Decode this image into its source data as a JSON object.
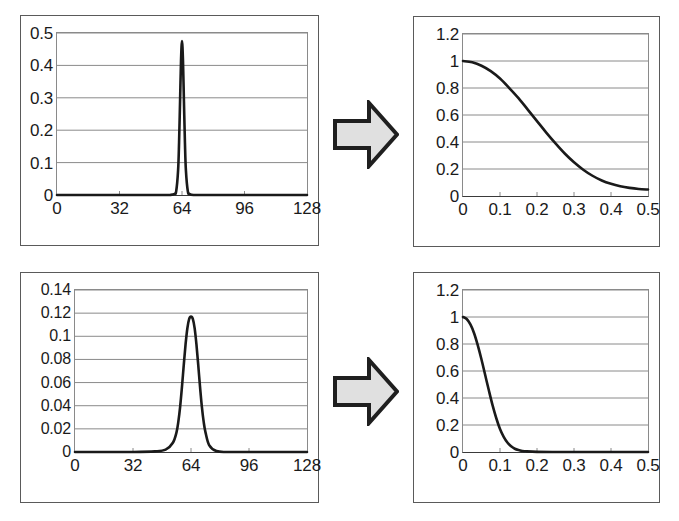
{
  "figure": {
    "title": "",
    "layout": "2x2 grid of plots with block arrows between left and right columns",
    "arrow_fill": "#e0e0e0",
    "arrow_stroke": "#1f1f1f",
    "line_color": "#1a1a1a",
    "grid_color": "#8a8a8a",
    "frame_color": "#5a5a5a",
    "background": "#ffffff"
  },
  "arrows": [
    {
      "name": "arrow-top",
      "label": "transform arrow"
    },
    {
      "name": "arrow-bottom",
      "label": "transform arrow"
    }
  ],
  "chart_data": [
    {
      "id": "top-left",
      "type": "line",
      "title": "",
      "xlabel": "",
      "ylabel": "",
      "xlim": [
        0,
        128
      ],
      "ylim": [
        0,
        0.5
      ],
      "grid": true,
      "legend": null,
      "xticks": [
        "0",
        "32",
        "64",
        "96",
        "128"
      ],
      "xtick_values": [
        0,
        32,
        64,
        96,
        128
      ],
      "yticks": [
        "0",
        "0.1",
        "0.2",
        "0.3",
        "0.4",
        "0.5"
      ],
      "ytick_values": [
        0,
        0.1,
        0.2,
        0.3,
        0.4,
        0.5
      ],
      "description": "Very narrow Gaussian pulse centred at x = 64, peak 0.475",
      "peak_x": 64,
      "peak_y": 0.475,
      "sigma": 1.7,
      "x": [
        0,
        8,
        16,
        24,
        32,
        40,
        48,
        52,
        56,
        58,
        60,
        61,
        62,
        62.5,
        63,
        63.5,
        64,
        64.5,
        65,
        65.5,
        66,
        67,
        68,
        70,
        72,
        76,
        80,
        88,
        96,
        104,
        112,
        120,
        128
      ],
      "values": [
        0,
        0,
        0,
        0,
        0,
        0,
        0,
        0,
        0,
        0.0002,
        0.003,
        0.011,
        0.076,
        0.162,
        0.288,
        0.415,
        0.475,
        0.415,
        0.288,
        0.162,
        0.076,
        0.011,
        0.003,
        0.0001,
        0,
        0,
        0,
        0,
        0,
        0,
        0,
        0,
        0
      ]
    },
    {
      "id": "top-right",
      "type": "line",
      "title": "",
      "xlabel": "",
      "ylabel": "",
      "xlim": [
        0,
        0.5
      ],
      "ylim": [
        0,
        1.2
      ],
      "grid": true,
      "legend": null,
      "xticks": [
        "0",
        "0.1",
        "0.2",
        "0.3",
        "0.4",
        "0.5"
      ],
      "xtick_values": [
        0,
        0.1,
        0.2,
        0.3,
        0.4,
        0.5
      ],
      "yticks": [
        "0",
        "0.2",
        "0.4",
        "0.6",
        "0.8",
        "1",
        "1.2"
      ],
      "ytick_values": [
        0,
        0.2,
        0.4,
        0.6,
        0.8,
        1.0,
        1.2
      ],
      "description": "Broad Gaussian decay from 1 at x = 0 down to about 0.05 at x = 0.5",
      "x": [
        0,
        0.025,
        0.05,
        0.075,
        0.1,
        0.125,
        0.15,
        0.175,
        0.2,
        0.225,
        0.25,
        0.275,
        0.3,
        0.325,
        0.35,
        0.375,
        0.4,
        0.425,
        0.45,
        0.475,
        0.5
      ],
      "values": [
        1.0,
        0.99,
        0.965,
        0.925,
        0.87,
        0.8,
        0.725,
        0.64,
        0.555,
        0.47,
        0.39,
        0.315,
        0.25,
        0.195,
        0.15,
        0.115,
        0.09,
        0.072,
        0.06,
        0.052,
        0.048
      ]
    },
    {
      "id": "bottom-left",
      "type": "line",
      "title": "",
      "xlabel": "",
      "ylabel": "",
      "xlim": [
        0,
        128
      ],
      "ylim": [
        0,
        0.14
      ],
      "grid": true,
      "legend": null,
      "xticks": [
        "0",
        "32",
        "64",
        "96",
        "128"
      ],
      "xtick_values": [
        0,
        32,
        64,
        96,
        128
      ],
      "yticks": [
        "0",
        "0.02",
        "0.04",
        "0.06",
        "0.08",
        "0.1",
        "0.12",
        "0.14"
      ],
      "ytick_values": [
        0,
        0.02,
        0.04,
        0.06,
        0.08,
        0.1,
        0.12,
        0.14
      ],
      "description": "Wider Gaussian pulse centred at x = 64, peak 0.117",
      "peak_x": 64,
      "peak_y": 0.117,
      "sigma": 3.4,
      "x": [
        0,
        16,
        32,
        44,
        50,
        54,
        56,
        57,
        58,
        59,
        60,
        61,
        62,
        63,
        64,
        65,
        66,
        67,
        68,
        69,
        70,
        71,
        72,
        74,
        78,
        84,
        96,
        112,
        128
      ],
      "values": [
        0,
        0,
        0,
        0.0005,
        0.002,
        0.008,
        0.017,
        0.026,
        0.039,
        0.056,
        0.075,
        0.093,
        0.107,
        0.115,
        0.117,
        0.115,
        0.107,
        0.093,
        0.075,
        0.056,
        0.039,
        0.026,
        0.017,
        0.006,
        0.0008,
        0,
        0,
        0,
        0
      ]
    },
    {
      "id": "bottom-right",
      "type": "line",
      "title": "",
      "xlabel": "",
      "ylabel": "",
      "xlim": [
        0,
        0.5
      ],
      "ylim": [
        0,
        1.2
      ],
      "grid": true,
      "legend": null,
      "xticks": [
        "0",
        "0.1",
        "0.2",
        "0.3",
        "0.4",
        "0.5"
      ],
      "xtick_values": [
        0,
        0.1,
        0.2,
        0.3,
        0.4,
        0.5
      ],
      "yticks": [
        "0",
        "0.2",
        "0.4",
        "0.6",
        "0.8",
        "1",
        "1.2"
      ],
      "ytick_values": [
        0,
        0.2,
        0.4,
        0.6,
        0.8,
        1.0,
        1.2
      ],
      "description": "Narrow Gaussian decay from 1 at x = 0 reaching nearly 0 by x = 0.17",
      "x": [
        0,
        0.01,
        0.02,
        0.03,
        0.04,
        0.05,
        0.06,
        0.07,
        0.08,
        0.09,
        0.1,
        0.11,
        0.12,
        0.13,
        0.14,
        0.15,
        0.16,
        0.17,
        0.2,
        0.25,
        0.3,
        0.35,
        0.4,
        0.45,
        0.5
      ],
      "values": [
        1.0,
        0.985,
        0.945,
        0.88,
        0.79,
        0.685,
        0.57,
        0.455,
        0.345,
        0.25,
        0.17,
        0.112,
        0.07,
        0.042,
        0.024,
        0.014,
        0.008,
        0.005,
        0.001,
        0,
        0,
        0,
        0,
        0,
        0
      ]
    }
  ]
}
